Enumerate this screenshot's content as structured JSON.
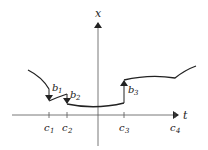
{
  "diagram": {
    "axes": {
      "vertical_label": "x",
      "horizontal_label": "t"
    },
    "ticks": [
      {
        "label": "c",
        "sub": "1",
        "x": 49
      },
      {
        "label": "c",
        "sub": "2",
        "x": 67
      },
      {
        "label": "c",
        "sub": "3",
        "x": 124
      },
      {
        "label": "c",
        "sub": "4",
        "x": 175
      }
    ],
    "jumps": [
      {
        "label": "b",
        "sub": "1",
        "direction": "down"
      },
      {
        "label": "b",
        "sub": "2",
        "direction": "down"
      },
      {
        "label": "b",
        "sub": "3",
        "direction": "up"
      }
    ],
    "colors": {
      "curve": "#222222",
      "axis": "#555555"
    }
  }
}
